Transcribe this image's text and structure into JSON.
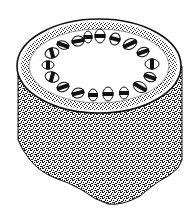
{
  "diagram": {
    "subject": "Stem cross-section illustration",
    "parts": [
      {
        "id": "epidermis",
        "label": "Epidermis"
      },
      {
        "id": "cortex",
        "label": "Cortex"
      },
      {
        "id": "vascular-bundles",
        "label": "Vascular bundles",
        "count": 20
      },
      {
        "id": "pith",
        "label": "Pith"
      },
      {
        "id": "stem-body",
        "label": "Stem body (stippled)"
      }
    ],
    "colors": {
      "ink": "#111111",
      "paper": "#ffffff",
      "stipple": "#3a3a3a"
    }
  }
}
